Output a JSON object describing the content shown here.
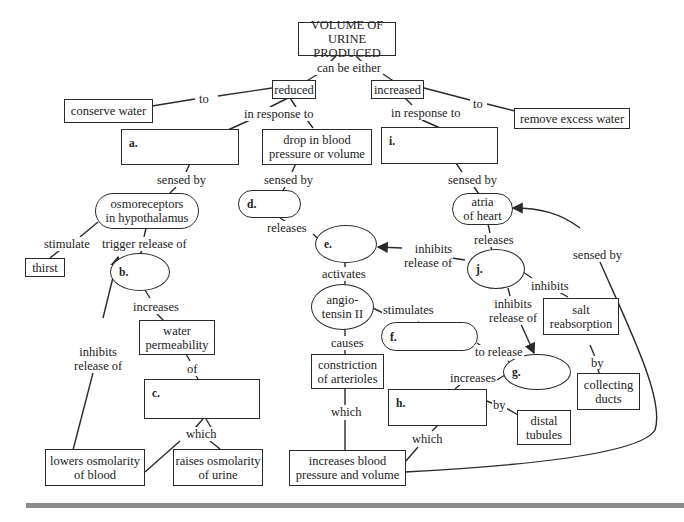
{
  "nodes": {
    "root": {
      "line1": "VOLUME OF",
      "line2": "URINE PRODUCED"
    },
    "reduced": "reduced",
    "increased": "increased",
    "conserve_water": "conserve water",
    "remove_excess_water": "remove excess water",
    "a": "a.",
    "drop_bp": {
      "line1": "drop in blood",
      "line2": "pressure or volume"
    },
    "i": "i.",
    "osmoreceptors": {
      "line1": "osmoreceptors",
      "line2": "in hypothalamus"
    },
    "d": "d.",
    "atria": {
      "line1": "atria",
      "line2": "of heart"
    },
    "thirst": "thirst",
    "b": "b.",
    "e": "e.",
    "j": "j.",
    "angiotensin": {
      "line1": "angio-",
      "line2": "tensin II"
    },
    "water_perm": {
      "line1": "water",
      "line2": "permeability"
    },
    "salt_reabs": {
      "line1": "salt",
      "line2": "reabsorption"
    },
    "f": "f.",
    "c": "c.",
    "constriction": {
      "line1": "constriction",
      "line2": "of arterioles"
    },
    "g": "g.",
    "collecting_ducts": {
      "line1": "collecting",
      "line2": "ducts"
    },
    "h": "h.",
    "distal_tubules": {
      "line1": "distal",
      "line2": "tubules"
    },
    "lowers_osm": {
      "line1": "lowers osmolarity",
      "line2": "of blood"
    },
    "raises_osm": {
      "line1": "raises osmolarity",
      "line2": "of urine"
    },
    "increases_bp": {
      "line1": "increases blood",
      "line2": "pressure and volume"
    }
  },
  "links": {
    "can_be_either": "can be either",
    "to_left": "to",
    "to_right": "to",
    "in_response_left": "in response to",
    "in_response_right": "in response to",
    "sensed_by_a": "sensed by",
    "sensed_by_drop": "sensed by",
    "sensed_by_i": "sensed by",
    "stimulate": "stimulate",
    "trigger_release": "trigger release of",
    "releases_d": "releases",
    "releases_atria": "releases",
    "inhibits_release_e": {
      "line1": "inhibits",
      "line2": "release of"
    },
    "activates": "activates",
    "inhibits_j": "inhibits",
    "increases_b": "increases",
    "inhibits_release_b": {
      "line1": "inhibits",
      "line2": "release of"
    },
    "causes": "causes",
    "stimulates": "stimulates",
    "inhibits_release_g": {
      "line1": "inhibits",
      "line2": "release of"
    },
    "of": "of",
    "to_release": "to release",
    "by_salt": "by",
    "increases_g": "increases",
    "by_h": "by",
    "which_c": "which",
    "which_constriction": "which",
    "which_h": "which",
    "sensed_by_loop": "sensed by"
  },
  "colors": {
    "stroke": "#2a2a2a",
    "divider": "#8a8a8a",
    "background": "#ffffff"
  }
}
